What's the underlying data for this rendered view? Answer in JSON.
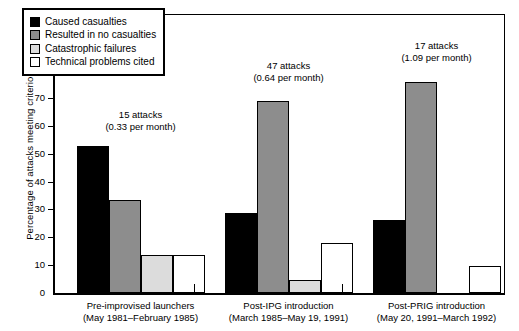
{
  "chart_data": {
    "type": "bar",
    "title": "",
    "xlabel": "",
    "ylabel": "Percentage of attacks meeting criterion",
    "ylim": [
      0,
      100
    ],
    "yticks": [
      0,
      10,
      20,
      30,
      40,
      50,
      60,
      70,
      80,
      90,
      100
    ],
    "grid": false,
    "legend_position": "top-left",
    "categories": [
      "Pre-improvised launchers\n(May 1981–February 1985)",
      "Post-IPG introduction\n(March 1985–May 19, 1991)",
      "Post-PRIG introduction\n(May 20, 1991–March 1992)"
    ],
    "series": [
      {
        "name": "Caused casualties",
        "color": "#000000",
        "values": [
          53,
          28.5,
          26
        ]
      },
      {
        "name": "Resulted in no casualties",
        "color": "#8d8d8d",
        "values": [
          33.5,
          69,
          76
        ]
      },
      {
        "name": "Catastrophic failures",
        "color": "#dcdcdc",
        "values": [
          13.5,
          4.5,
          0
        ]
      },
      {
        "name": "Technical problems cited",
        "color": "#ffffff",
        "values": [
          13.5,
          18,
          9.5
        ]
      }
    ],
    "annotations": [
      {
        "group": 0,
        "line1": "15 attacks",
        "line2": "(0.33 per month)"
      },
      {
        "group": 1,
        "line1": "47 attacks",
        "line2": "(0.64 per month)"
      },
      {
        "group": 2,
        "line1": "17 attacks",
        "line2": "(1.09 per month)"
      }
    ]
  },
  "legend": {
    "items": [
      {
        "label": "Caused casualties",
        "swatch": "sw-black"
      },
      {
        "label": "Resulted in no casualties",
        "swatch": "sw-gray"
      },
      {
        "label": "Catastrophic failures",
        "swatch": "sw-ltgray"
      },
      {
        "label": "Technical problems cited",
        "swatch": "sw-white"
      }
    ]
  },
  "xaxis": {
    "groups": [
      {
        "line1": "Pre-improvised launchers",
        "line2": "(May 1981–February 1985)"
      },
      {
        "line1": "Post-IPG introduction",
        "line2": "(March 1985–May 19, 1991)"
      },
      {
        "line1": "Post-PRIG introduction",
        "line2": "(May 20, 1991–March 1992)"
      }
    ]
  },
  "yaxis": {
    "title": "Percentage of attacks meeting criterion",
    "ticks": [
      "100",
      "90",
      "80",
      "70",
      "60",
      "50",
      "40",
      "30",
      "20",
      "10",
      "0"
    ]
  }
}
